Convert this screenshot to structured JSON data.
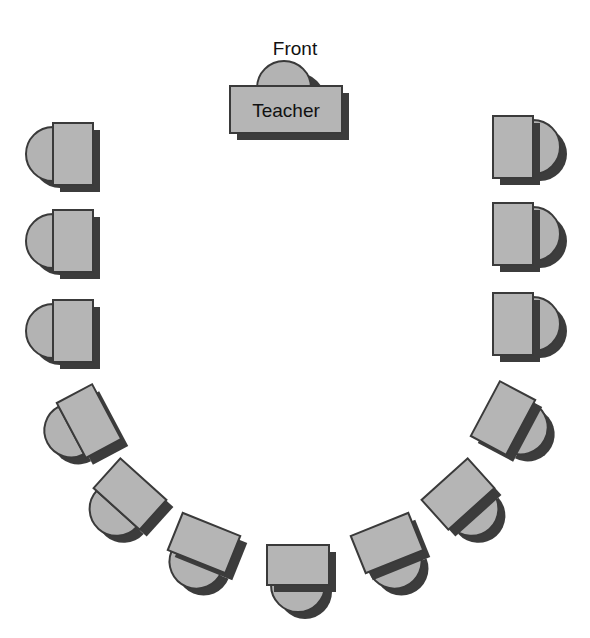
{
  "diagram": {
    "front_label": "Front",
    "teacher_label": "Teacher",
    "colors": {
      "desk": "#b5b5b5",
      "chair": "#b3b3b3",
      "outline": "#3a3a3a",
      "shadow": "#3c3c3c",
      "background": "#ffffff"
    },
    "teacher_desk": {
      "x": 230,
      "y": 86,
      "width": 112,
      "height": 47,
      "chair_cx": 284,
      "chair_r": 27
    },
    "student_desks": [
      {
        "id": "left-1",
        "cx": 73,
        "cy": 154,
        "rotate": 0
      },
      {
        "id": "left-2",
        "cx": 73,
        "cy": 241,
        "rotate": 0
      },
      {
        "id": "left-3",
        "cx": 73,
        "cy": 331,
        "rotate": 0
      },
      {
        "id": "curve-left-1",
        "cx": 89,
        "cy": 421,
        "rotate": -28
      },
      {
        "id": "curve-left-2",
        "cx": 130,
        "cy": 494,
        "rotate": -48
      },
      {
        "id": "curve-left-3",
        "cx": 204,
        "cy": 543,
        "rotate": -68
      },
      {
        "id": "bottom-center",
        "cx": 298,
        "cy": 565,
        "rotate": -90
      },
      {
        "id": "curve-right-3",
        "cx": 387,
        "cy": 543,
        "rotate": -112
      },
      {
        "id": "curve-right-2",
        "cx": 458,
        "cy": 494,
        "rotate": -132
      },
      {
        "id": "curve-right-1",
        "cx": 503,
        "cy": 418,
        "rotate": -152
      },
      {
        "id": "right-3",
        "cx": 513,
        "cy": 324,
        "rotate": 180
      },
      {
        "id": "right-2",
        "cx": 513,
        "cy": 234,
        "rotate": 180
      },
      {
        "id": "right-1",
        "cx": 513,
        "cy": 147,
        "rotate": 180
      }
    ],
    "student_desk_count": 13
  }
}
